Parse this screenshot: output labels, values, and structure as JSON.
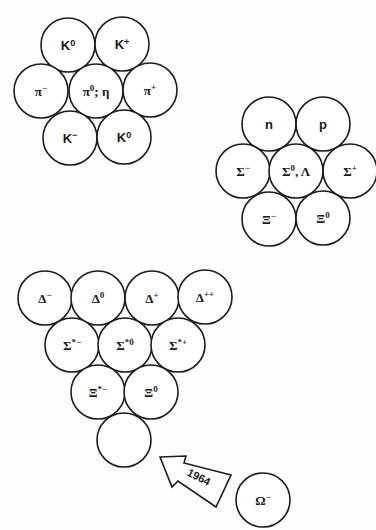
{
  "meson_octet": {
    "particles": [
      {
        "base": "K",
        "sup": "0",
        "tail": ""
      },
      {
        "base": "K",
        "sup": "+",
        "tail": ""
      },
      {
        "base": "π",
        "sup": "−",
        "tail": ""
      },
      {
        "base": "π",
        "sup": "0",
        "tail": "; η"
      },
      {
        "base": "π",
        "sup": "+",
        "tail": ""
      },
      {
        "base": "K",
        "sup": "−",
        "tail": ""
      },
      {
        "base": "K",
        "sup": "0",
        "tail": ""
      }
    ]
  },
  "baryon_octet": {
    "particles": [
      {
        "base": "n",
        "sup": "",
        "tail": ""
      },
      {
        "base": "p",
        "sup": "",
        "tail": ""
      },
      {
        "base": "Σ",
        "sup": "−",
        "tail": ""
      },
      {
        "base": "Σ",
        "sup": "0",
        "tail": ", Λ"
      },
      {
        "base": "Σ",
        "sup": "+",
        "tail": ""
      },
      {
        "base": "Ξ",
        "sup": "−",
        "tail": ""
      },
      {
        "base": "Ξ",
        "sup": "0",
        "tail": ""
      }
    ]
  },
  "baryon_decuplet": {
    "particles": [
      {
        "base": "Δ",
        "sup": "−"
      },
      {
        "base": "Δ",
        "sup": "0"
      },
      {
        "base": "Δ",
        "sup": "+"
      },
      {
        "base": "Δ",
        "sup": "++"
      },
      {
        "base": "Σ",
        "sup": "*−"
      },
      {
        "base": "Σ",
        "sup": "*0"
      },
      {
        "base": "Σ",
        "sup": "*+"
      },
      {
        "base": "Ξ",
        "sup": "*−"
      },
      {
        "base": "Ξ",
        "sup": "0"
      },
      {
        "base": "",
        "sup": ""
      }
    ]
  },
  "prediction": {
    "arrow_label": "1964",
    "particle": {
      "base": "Ω",
      "sup": "−"
    }
  }
}
